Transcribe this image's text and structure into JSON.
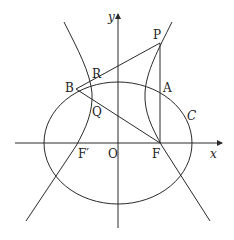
{
  "diagram": {
    "type": "geometry",
    "axes": {
      "x_label": "x",
      "y_label": "y",
      "origin_label": "O"
    },
    "labels": {
      "P": "P",
      "A": "A",
      "C": "C",
      "B": "B",
      "R": "R",
      "Q": "Q",
      "F": "F",
      "F_prime": "F′",
      "O": "O",
      "x": "x",
      "y": "y"
    },
    "colors": {
      "stroke": "#2a2a2a",
      "background": "#ffffff"
    }
  }
}
